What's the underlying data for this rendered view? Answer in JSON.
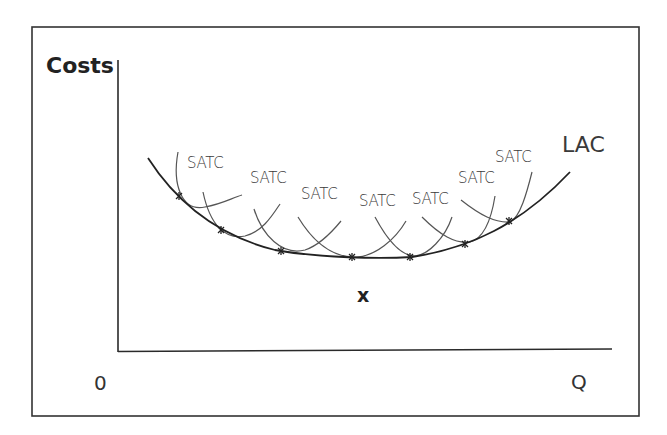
{
  "diagram": {
    "y_axis_label": "Costs",
    "x_axis_label": "Q",
    "origin_label": "0",
    "curve_label": "LAC",
    "short_run_label": "SATC",
    "minimum_label": "x",
    "satc_labels": [
      "SATC",
      "SATC",
      "SATC",
      "SATC",
      "SATC",
      "SATC",
      "SATC"
    ],
    "colors": {
      "line": "#2a2a2a",
      "satc": "#555555",
      "frame": "#333333"
    }
  }
}
